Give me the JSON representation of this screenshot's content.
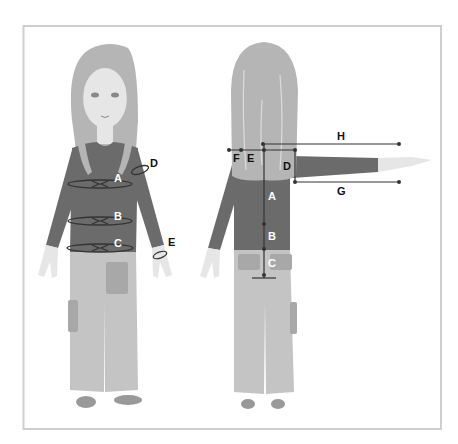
{
  "diagram": {
    "front_view": {
      "labels": [
        {
          "id": "A",
          "text": "A",
          "meaning": "chest"
        },
        {
          "id": "B",
          "text": "B",
          "meaning": "waist"
        },
        {
          "id": "C",
          "text": "C",
          "meaning": "hips"
        },
        {
          "id": "D",
          "text": "D",
          "meaning": "upper arm"
        },
        {
          "id": "E",
          "text": "E",
          "meaning": "wrist"
        }
      ]
    },
    "back_view": {
      "labels": [
        {
          "id": "A",
          "text": "A"
        },
        {
          "id": "B",
          "text": "B"
        },
        {
          "id": "C",
          "text": "C"
        },
        {
          "id": "D",
          "text": "D"
        },
        {
          "id": "E",
          "text": "E"
        },
        {
          "id": "F",
          "text": "F"
        },
        {
          "id": "G",
          "text": "G"
        },
        {
          "id": "H",
          "text": "H"
        }
      ]
    },
    "colors": {
      "frame": "#cfcfcf",
      "hair": "#b5b5b5",
      "skin": "#e6e6e6",
      "shirt": "#6b6b6b",
      "pants": "#c4c4c4",
      "lines": "#333333",
      "label_dark": "#111111",
      "label_light": "#ffffff"
    }
  }
}
